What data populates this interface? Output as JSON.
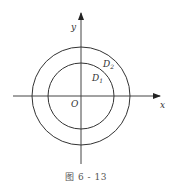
{
  "figure": {
    "caption": "图 6 - 13",
    "axes": {
      "x_label": "x",
      "y_label": "y",
      "origin_label": "O"
    },
    "regions": {
      "inner": "D",
      "inner_sub": "1",
      "outer": "D",
      "outer_sub": "2"
    },
    "shapes": [
      {
        "type": "circle",
        "name": "inner-circle",
        "cx": 81,
        "cy": 96,
        "r": 33
      },
      {
        "type": "circle",
        "name": "outer-circle",
        "cx": 81,
        "cy": 96,
        "r": 49
      }
    ],
    "colors": {
      "stroke": "#333333",
      "background": "#ffffff"
    }
  }
}
